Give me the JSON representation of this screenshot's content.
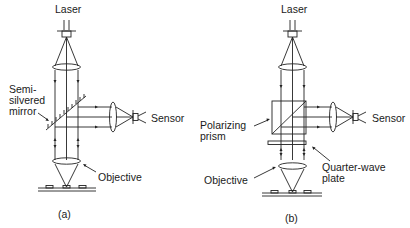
{
  "figure": {
    "panel_a": {
      "caption": "(a)",
      "labels": {
        "laser": "Laser",
        "mirror": "Semi-\nsilvered\nmirror",
        "sensor": "Sensor",
        "objective": "Objective"
      }
    },
    "panel_b": {
      "caption": "(b)",
      "labels": {
        "laser": "Laser",
        "prism": "Polarizing\nprism",
        "sensor": "Sensor",
        "objective": "Objective",
        "plate": "Quarter-wave\nplate"
      }
    },
    "colors": {
      "ink": "#222222",
      "background": "#ffffff"
    }
  }
}
